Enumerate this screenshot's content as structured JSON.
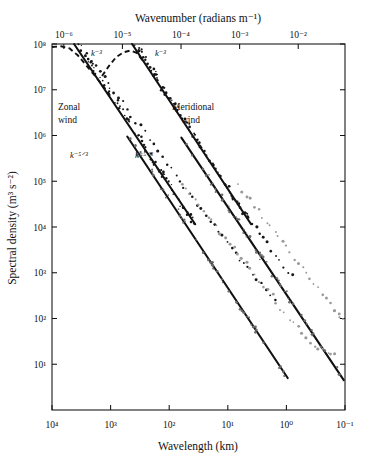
{
  "chart_data": {
    "type": "scatter",
    "title": "",
    "xlabel": "Wavelength (km)",
    "ylabel": "Spectral density (m³ s⁻²)",
    "x2label": "Wavenumber (radians m⁻¹)",
    "grid": false,
    "legend_position": "none",
    "x_scale": "log",
    "y_scale": "log",
    "x_axis_direction": "decreasing",
    "xlim": [
      10000,
      0.1
    ],
    "ylim": [
      1,
      100000000
    ],
    "x2lim": [
      6.28e-07,
      0.0628
    ],
    "xticks": [
      "10⁴",
      "10³",
      "10²",
      "10¹",
      "10⁰",
      "10⁻¹"
    ],
    "xtick_values": [
      10000,
      1000,
      100,
      10,
      1,
      0.1
    ],
    "yticks": [
      "10⁸",
      "10⁷",
      "10⁶",
      "10⁵",
      "10⁴",
      "10³",
      "10²",
      "10¹"
    ],
    "ytick_values": [
      100000000,
      10000000,
      1000000,
      100000,
      10000,
      1000,
      100,
      10
    ],
    "x2ticks": [
      "10⁻⁶",
      "10⁻⁵",
      "10⁻⁴",
      "10⁻³",
      "10⁻²"
    ],
    "annotations": [
      {
        "name": "zonal-wind-label",
        "text": "Zonal",
        "text2": "wind"
      },
      {
        "name": "meridional-wind-label",
        "text": "Meridional",
        "text2": "wind"
      },
      {
        "name": "slope-k3-zonal",
        "text": "k⁻³"
      },
      {
        "name": "slope-k3-meridional",
        "text": "k⁻³"
      },
      {
        "name": "slope-k53-zonal",
        "text": "k⁻⁵ᐟ³"
      },
      {
        "name": "slope-k53-meridional",
        "text": "k⁻⁵ᐟ³"
      }
    ],
    "series": [
      {
        "name": "zonal-wind-spectrum",
        "style": "points",
        "color": "#15151a",
        "points_xy": [
          [
            3200,
            80000000.0
          ],
          [
            2600,
            60000000.0
          ],
          [
            2150,
            46000000.0
          ],
          [
            1800,
            33000000.0
          ],
          [
            1500,
            24000000.0
          ],
          [
            1250,
            17500000.0
          ],
          [
            1050,
            13000000.0
          ],
          [
            880,
            9500000.0
          ],
          [
            740,
            7000000.0
          ],
          [
            620,
            5200000.0
          ],
          [
            520,
            3800000.0
          ],
          [
            440,
            2800000.0
          ],
          [
            370,
            2100000.0
          ],
          [
            310,
            1550000.0
          ],
          [
            260,
            1150000.0
          ],
          [
            215,
            800000.0
          ],
          [
            180,
            580000.0
          ],
          [
            152,
            430000.0
          ],
          [
            128,
            320000.0
          ],
          [
            108,
            240000.0
          ],
          [
            91,
            180000.0
          ],
          [
            77,
            135000.0
          ],
          [
            65,
            100000.0
          ],
          [
            55,
            76000.0
          ],
          [
            46,
            58000.0
          ],
          [
            39,
            44000.0
          ],
          [
            33,
            33000.0
          ],
          [
            28,
            25000.0
          ],
          [
            23.5,
            19000.0
          ],
          [
            20,
            14500.0
          ],
          [
            17,
            11000.0
          ],
          [
            14.3,
            8300.0
          ],
          [
            12.1,
            6300.0
          ],
          [
            10.2,
            4800.0
          ],
          [
            8.6,
            3600.0
          ],
          [
            7.3,
            2750.0
          ],
          [
            6.2,
            2100.0
          ],
          [
            5.2,
            1600.0
          ],
          [
            4.4,
            1200.0
          ],
          [
            3.7,
            920.0
          ],
          [
            3.15,
            700.0
          ],
          [
            2.65,
            530.0
          ],
          [
            2.25,
            400.0
          ],
          [
            1.9,
            310.0
          ],
          [
            1.6,
            235.0
          ]
        ]
      },
      {
        "name": "zonal-wind-spectrum-gray",
        "style": "points",
        "color": "#9a9a9a",
        "points_xy": [
          [
            62,
            90000.0
          ],
          [
            52,
            68000.0
          ],
          [
            44,
            52000.0
          ],
          [
            37,
            40000.0
          ],
          [
            31,
            30000.0
          ],
          [
            26,
            23000.0
          ],
          [
            22,
            17500.0
          ],
          [
            18.6,
            13300.0
          ],
          [
            15.7,
            10000.0
          ],
          [
            13.3,
            7700.0
          ],
          [
            11.2,
            5900.0
          ],
          [
            9.5,
            4500.0
          ],
          [
            8.0,
            3400.0
          ],
          [
            6.8,
            2600.0
          ],
          [
            5.75,
            2000.0
          ],
          [
            4.85,
            1500.0
          ],
          [
            4.1,
            1150.0
          ],
          [
            3.45,
            880.0
          ],
          [
            2.92,
            670.0
          ],
          [
            2.47,
            510.0
          ],
          [
            2.08,
            390.0
          ],
          [
            1.76,
            300.0
          ],
          [
            1.49,
            230.0
          ],
          [
            1.26,
            170.0
          ],
          [
            1.06,
            130.0
          ],
          [
            0.9,
            100.0
          ],
          [
            0.76,
            78
          ],
          [
            0.64,
            60
          ],
          [
            0.54,
            46
          ],
          [
            0.46,
            38
          ],
          [
            0.39,
            32
          ],
          [
            0.33,
            27
          ],
          [
            0.28,
            24
          ],
          [
            0.235,
            21
          ],
          [
            0.2,
            19
          ],
          [
            0.17,
            17.5
          ],
          [
            0.144,
            16.5
          ]
        ]
      },
      {
        "name": "meridional-wind-spectrum",
        "style": "points",
        "color": "#15151a",
        "points_xy": [
          [
            330,
            65000000.0
          ],
          [
            285,
            50000000.0
          ],
          [
            245,
            37000000.0
          ],
          [
            210,
            27000000.0
          ],
          [
            180,
            20000000.0
          ],
          [
            155,
            15000000.0
          ],
          [
            133,
            11000000.0
          ],
          [
            114,
            8000000.0
          ],
          [
            98,
            6000000.0
          ],
          [
            84,
            4400000.0
          ],
          [
            72,
            3300000.0
          ],
          [
            62,
            2450000.0
          ],
          [
            53,
            1800000.0
          ],
          [
            45,
            1350000.0
          ],
          [
            39,
            1000000.0
          ],
          [
            33,
            740000.0
          ],
          [
            28.5,
            550000.0
          ],
          [
            24.4,
            410000.0
          ],
          [
            21,
            305000.0
          ],
          [
            18,
            230000.0
          ],
          [
            15.4,
            170000.0
          ],
          [
            13.2,
            127000.0
          ],
          [
            11.3,
            95000.0
          ],
          [
            9.7,
            71000.0
          ],
          [
            8.3,
            53000.0
          ],
          [
            7.1,
            40000.0
          ],
          [
            6.1,
            30000.0
          ],
          [
            5.25,
            22500.0
          ],
          [
            4.5,
            17000.0
          ],
          [
            3.85,
            13000.0
          ],
          [
            3.3,
            9700.0
          ],
          [
            2.83,
            7300.0
          ],
          [
            2.42,
            5500.0
          ],
          [
            2.08,
            4200.0
          ],
          [
            1.78,
            3200.0
          ],
          [
            1.52,
            2400.0
          ],
          [
            1.31,
            1850.0
          ],
          [
            1.12,
            1400.0
          ],
          [
            0.96,
            1070.0
          ],
          [
            0.82,
            820.0
          ]
        ]
      },
      {
        "name": "meridional-wind-spectrum-gray",
        "style": "points",
        "color": "#9a9a9a",
        "points_xy": [
          [
            6.4,
            84000.0
          ],
          [
            5.5,
            64000.0
          ],
          [
            4.7,
            49000.0
          ],
          [
            4.0,
            38000.0
          ],
          [
            3.45,
            29000.0
          ],
          [
            2.95,
            22500.0
          ],
          [
            2.52,
            17200.0
          ],
          [
            2.16,
            13200.0
          ],
          [
            1.85,
            10200.0
          ],
          [
            1.58,
            7800.0
          ],
          [
            1.35,
            6000.0
          ],
          [
            1.16,
            4600.0
          ],
          [
            0.99,
            3550.0
          ],
          [
            0.85,
            2720.0
          ],
          [
            0.72,
            2090.0
          ],
          [
            0.62,
            1600.0
          ],
          [
            0.53,
            1230.0
          ],
          [
            0.45,
            950.0
          ],
          [
            0.39,
            730.0
          ],
          [
            0.33,
            560.0
          ],
          [
            0.285,
            430.0
          ],
          [
            0.244,
            330.0
          ],
          [
            0.209,
            255.0
          ],
          [
            0.178,
            200.0
          ],
          [
            0.153,
            160.0
          ],
          [
            0.131,
            130.0
          ],
          [
            0.112,
            108.0
          ],
          [
            0.123,
            118.0
          ],
          [
            0.143,
            145.0
          ]
        ]
      }
    ],
    "fit_lines": [
      {
        "name": "k3-fit-zonal",
        "slope_label": "k⁻³",
        "x0": 4200,
        "y0": 140000000.0,
        "x1": 36,
        "y1": 11500.0
      },
      {
        "name": "k3-fit-meridional",
        "slope_label": "k⁻³",
        "x0": 430,
        "y0": 135000000.0,
        "x1": 4.0,
        "y1": 11500.0
      },
      {
        "name": "k53-fit-zonal",
        "slope_label": "k⁻⁵ᐟ³",
        "x0": 520,
        "y0": 950000.0,
        "x1": 0.95,
        "y1": 5.0
      },
      {
        "name": "k53-fit-meridional",
        "slope_label": "k⁻⁵ᐟ³",
        "x0": 62,
        "y0": 900000.0,
        "x1": 0.105,
        "y1": 4.5
      }
    ],
    "dashed_curves": [
      {
        "name": "dashed-curve-zonal",
        "points_xy": [
          [
            10000,
            86000000.0
          ],
          [
            7000,
            89000000.0
          ],
          [
            5000,
            80000000.0
          ],
          [
            3600,
            56000000.0
          ],
          [
            2600,
            34000000.0
          ],
          [
            1900,
            21000000.0
          ],
          [
            1400,
            13000000.0
          ],
          [
            1050,
            8000000.0
          ]
        ]
      },
      {
        "name": "dashed-curve-meridional",
        "points_xy": [
          [
            1400,
            20000000.0
          ],
          [
            1050,
            34000000.0
          ],
          [
            800,
            52000000.0
          ],
          [
            600,
            66000000.0
          ],
          [
            460,
            72000000.0
          ],
          [
            360,
            64000000.0
          ],
          [
            285,
            44000000.0
          ]
        ]
      }
    ]
  },
  "axes": {
    "top_title": "Wavenumber (radians m⁻¹)",
    "bottom_title": "Wavelength (km)",
    "left_title": "Spectral density (m³ s⁻²)"
  },
  "labels": {
    "zonal_line1": "Zonal",
    "zonal_line2": "wind",
    "meridional_line1": "Meridional",
    "meridional_line2": "wind",
    "k3_a": "k⁻³",
    "k3_b": "k⁻³",
    "k53_a": "k⁻⁵ᐟ³",
    "k53_b": "k⁻⁵ᐟ³"
  },
  "colors": {
    "ink": "#111111",
    "point_dark": "#15151a",
    "point_gray": "#9a9a9a",
    "background": "#ffffff"
  }
}
